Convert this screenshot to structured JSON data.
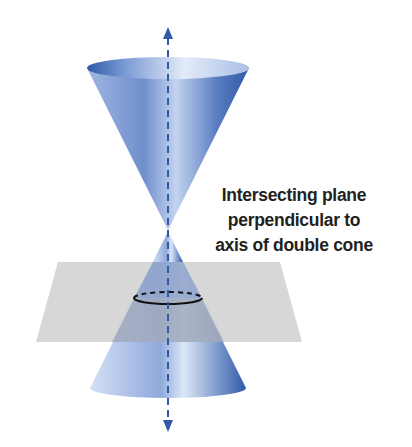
{
  "diagram": {
    "type": "double-cone-with-intersecting-plane",
    "label_lines": [
      "Intersecting plane",
      "perpendicular to",
      "axis of double cone"
    ],
    "colors": {
      "cone_dark": "#2f5aa8",
      "cone_light": "#c7d6f0",
      "plane": "#c8c8c8",
      "axis": "#2f5aa8",
      "circle": "#111111",
      "text": "#231f20"
    },
    "elements": [
      "upper-nappe",
      "lower-nappe",
      "axis-with-arrows",
      "horizontal-plane",
      "circle-cross-section"
    ]
  }
}
